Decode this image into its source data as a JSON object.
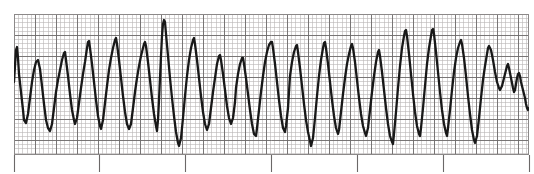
{
  "document": {
    "title": "ECG Rhythm Strip",
    "kind": "electrocardiogram-tracing",
    "background_color": "#ffffff"
  },
  "grid": {
    "x": 14,
    "y": 14,
    "width": 515,
    "height": 141,
    "minor_cell_px": 4.2,
    "major_every_minor_cells": 5,
    "minor_color": "#b9b6b6",
    "major_color": "#6e6b6b",
    "border_color": "#8c8989",
    "minor_line_width": 0.6,
    "major_line_width": 0.9,
    "label": "ECG graph paper"
  },
  "axis_ticks": {
    "label": "time calibration marks",
    "color": "#6b6868",
    "line_width": 1.1,
    "top_y": 155,
    "bottom_y": 172,
    "positions_px": [
      14,
      99,
      185,
      271,
      357,
      443,
      529
    ]
  },
  "trace": {
    "label": "ECG waveform trace",
    "color": "#181818",
    "line_width": 2.3,
    "baseline_y": 88,
    "rhythm": "polymorphic wide-complex tachycardia",
    "amplitude_trend": "attenuating toward right edge"
  },
  "chart_data": {
    "type": "line",
    "xlabel": "Time",
    "ylabel": "Amplitude",
    "grid": true,
    "legend": "none",
    "xlim": [
      14,
      529
    ],
    "ylim": [
      155,
      14
    ],
    "series": [
      {
        "name": "ECG lead tracing",
        "points": [
          [
            14,
            82
          ],
          [
            15,
            66
          ],
          [
            16,
            50
          ],
          [
            17,
            47
          ],
          [
            18,
            58
          ],
          [
            19,
            74
          ],
          [
            21,
            92
          ],
          [
            23,
            110
          ],
          [
            24,
            120
          ],
          [
            26,
            123
          ],
          [
            28,
            114
          ],
          [
            30,
            98
          ],
          [
            32,
            82
          ],
          [
            34,
            70
          ],
          [
            36,
            62
          ],
          [
            38,
            60
          ],
          [
            40,
            69
          ],
          [
            42,
            86
          ],
          [
            44,
            104
          ],
          [
            46,
            120
          ],
          [
            48,
            128
          ],
          [
            50,
            131
          ],
          [
            52,
            124
          ],
          [
            54,
            108
          ],
          [
            56,
            92
          ],
          [
            58,
            80
          ],
          [
            60,
            70
          ],
          [
            62,
            60
          ],
          [
            64,
            53
          ],
          [
            65,
            52
          ],
          [
            66,
            60
          ],
          [
            68,
            76
          ],
          [
            70,
            94
          ],
          [
            72,
            110
          ],
          [
            74,
            120
          ],
          [
            75,
            124
          ],
          [
            77,
            118
          ],
          [
            79,
            103
          ],
          [
            81,
            88
          ],
          [
            83,
            74
          ],
          [
            85,
            62
          ],
          [
            86,
            55
          ],
          [
            87,
            48
          ],
          [
            88,
            42
          ],
          [
            89,
            41
          ],
          [
            90,
            48
          ],
          [
            92,
            64
          ],
          [
            94,
            82
          ],
          [
            96,
            100
          ],
          [
            98,
            116
          ],
          [
            100,
            126
          ],
          [
            101,
            129
          ],
          [
            103,
            120
          ],
          [
            105,
            103
          ],
          [
            107,
            86
          ],
          [
            109,
            70
          ],
          [
            111,
            58
          ],
          [
            113,
            48
          ],
          [
            115,
            40
          ],
          [
            116,
            38
          ],
          [
            117,
            44
          ],
          [
            119,
            60
          ],
          [
            121,
            78
          ],
          [
            123,
            96
          ],
          [
            125,
            112
          ],
          [
            127,
            124
          ],
          [
            129,
            129
          ],
          [
            131,
            124
          ],
          [
            133,
            108
          ],
          [
            135,
            92
          ],
          [
            137,
            78
          ],
          [
            139,
            66
          ],
          [
            141,
            56
          ],
          [
            143,
            48
          ],
          [
            144,
            44
          ],
          [
            145,
            42
          ],
          [
            146,
            46
          ],
          [
            148,
            62
          ],
          [
            150,
            80
          ],
          [
            152,
            98
          ],
          [
            154,
            114
          ],
          [
            156,
            126
          ],
          [
            157,
            131
          ],
          [
            158,
            120
          ],
          [
            159,
            100
          ],
          [
            160,
            78
          ],
          [
            161,
            56
          ],
          [
            162,
            36
          ],
          [
            163,
            24
          ],
          [
            164,
            20
          ],
          [
            165,
            22
          ],
          [
            166,
            34
          ],
          [
            168,
            56
          ],
          [
            170,
            78
          ],
          [
            172,
            98
          ],
          [
            174,
            116
          ],
          [
            176,
            132
          ],
          [
            178,
            143
          ],
          [
            179,
            146
          ],
          [
            181,
            138
          ],
          [
            183,
            118
          ],
          [
            185,
            96
          ],
          [
            187,
            76
          ],
          [
            189,
            60
          ],
          [
            191,
            48
          ],
          [
            193,
            40
          ],
          [
            194,
            38
          ],
          [
            195,
            44
          ],
          [
            197,
            60
          ],
          [
            199,
            78
          ],
          [
            201,
            96
          ],
          [
            203,
            112
          ],
          [
            205,
            124
          ],
          [
            207,
            130
          ],
          [
            209,
            124
          ],
          [
            211,
            108
          ],
          [
            213,
            92
          ],
          [
            215,
            78
          ],
          [
            217,
            64
          ],
          [
            219,
            56
          ],
          [
            220,
            55
          ],
          [
            221,
            60
          ],
          [
            223,
            74
          ],
          [
            225,
            90
          ],
          [
            227,
            106
          ],
          [
            229,
            118
          ],
          [
            231,
            124
          ],
          [
            233,
            118
          ],
          [
            235,
            102
          ],
          [
            236,
            88
          ],
          [
            238,
            74
          ],
          [
            240,
            64
          ],
          [
            242,
            58
          ],
          [
            243,
            58
          ],
          [
            244,
            64
          ],
          [
            246,
            78
          ],
          [
            248,
            94
          ],
          [
            250,
            110
          ],
          [
            252,
            124
          ],
          [
            254,
            134
          ],
          [
            256,
            136
          ],
          [
            257,
            128
          ],
          [
            259,
            110
          ],
          [
            261,
            92
          ],
          [
            263,
            76
          ],
          [
            265,
            62
          ],
          [
            267,
            52
          ],
          [
            269,
            45
          ],
          [
            271,
            42
          ],
          [
            272,
            42
          ],
          [
            273,
            48
          ],
          [
            275,
            64
          ],
          [
            277,
            82
          ],
          [
            279,
            100
          ],
          [
            281,
            116
          ],
          [
            283,
            128
          ],
          [
            285,
            132
          ],
          [
            286,
            126
          ],
          [
            288,
            108
          ],
          [
            289,
            92
          ],
          [
            290,
            76
          ],
          [
            292,
            62
          ],
          [
            294,
            52
          ],
          [
            296,
            46
          ],
          [
            297,
            45
          ],
          [
            298,
            52
          ],
          [
            300,
            68
          ],
          [
            302,
            86
          ],
          [
            304,
            104
          ],
          [
            306,
            120
          ],
          [
            308,
            132
          ],
          [
            310,
            141
          ],
          [
            311,
            146
          ],
          [
            313,
            138
          ],
          [
            315,
            118
          ],
          [
            317,
            96
          ],
          [
            319,
            76
          ],
          [
            321,
            60
          ],
          [
            323,
            48
          ],
          [
            324,
            43
          ],
          [
            325,
            42
          ],
          [
            326,
            48
          ],
          [
            328,
            64
          ],
          [
            330,
            82
          ],
          [
            332,
            100
          ],
          [
            334,
            116
          ],
          [
            336,
            128
          ],
          [
            338,
            134
          ],
          [
            339,
            130
          ],
          [
            341,
            112
          ],
          [
            343,
            94
          ],
          [
            345,
            78
          ],
          [
            347,
            64
          ],
          [
            349,
            54
          ],
          [
            351,
            46
          ],
          [
            352,
            44
          ],
          [
            353,
            48
          ],
          [
            355,
            62
          ],
          [
            357,
            80
          ],
          [
            359,
            98
          ],
          [
            361,
            114
          ],
          [
            363,
            126
          ],
          [
            365,
            133
          ],
          [
            366,
            136
          ],
          [
            368,
            128
          ],
          [
            370,
            110
          ],
          [
            372,
            92
          ],
          [
            374,
            76
          ],
          [
            376,
            62
          ],
          [
            378,
            52
          ],
          [
            379,
            50
          ],
          [
            380,
            56
          ],
          [
            382,
            72
          ],
          [
            384,
            90
          ],
          [
            386,
            108
          ],
          [
            388,
            124
          ],
          [
            390,
            136
          ],
          [
            392,
            142
          ],
          [
            393,
            144
          ],
          [
            394,
            134
          ],
          [
            396,
            112
          ],
          [
            398,
            88
          ],
          [
            400,
            66
          ],
          [
            402,
            48
          ],
          [
            404,
            36
          ],
          [
            405,
            31
          ],
          [
            406,
            30
          ],
          [
            407,
            36
          ],
          [
            409,
            54
          ],
          [
            411,
            74
          ],
          [
            413,
            94
          ],
          [
            415,
            112
          ],
          [
            417,
            126
          ],
          [
            419,
            134
          ],
          [
            420,
            136
          ],
          [
            421,
            128
          ],
          [
            423,
            108
          ],
          [
            425,
            86
          ],
          [
            427,
            64
          ],
          [
            429,
            48
          ],
          [
            431,
            36
          ],
          [
            432,
            30
          ],
          [
            433,
            29
          ],
          [
            434,
            34
          ],
          [
            436,
            52
          ],
          [
            438,
            72
          ],
          [
            440,
            92
          ],
          [
            442,
            110
          ],
          [
            444,
            124
          ],
          [
            446,
            133
          ],
          [
            447,
            136
          ],
          [
            448,
            128
          ],
          [
            450,
            110
          ],
          [
            452,
            90
          ],
          [
            454,
            72
          ],
          [
            456,
            58
          ],
          [
            458,
            48
          ],
          [
            460,
            42
          ],
          [
            461,
            40
          ],
          [
            462,
            44
          ],
          [
            464,
            58
          ],
          [
            466,
            76
          ],
          [
            468,
            96
          ],
          [
            470,
            114
          ],
          [
            472,
            130
          ],
          [
            474,
            140
          ],
          [
            475,
            143
          ],
          [
            477,
            136
          ],
          [
            479,
            118
          ],
          [
            481,
            98
          ],
          [
            483,
            80
          ],
          [
            485,
            66
          ],
          [
            487,
            54
          ],
          [
            488,
            48
          ],
          [
            489,
            46
          ],
          [
            491,
            50
          ],
          [
            493,
            60
          ],
          [
            495,
            72
          ],
          [
            497,
            82
          ],
          [
            499,
            88
          ],
          [
            500,
            90
          ],
          [
            502,
            86
          ],
          [
            504,
            78
          ],
          [
            506,
            70
          ],
          [
            507,
            66
          ],
          [
            508,
            64
          ],
          [
            509,
            68
          ],
          [
            511,
            78
          ],
          [
            513,
            88
          ],
          [
            514,
            92
          ],
          [
            515,
            90
          ],
          [
            516,
            84
          ],
          [
            517,
            78
          ],
          [
            518,
            74
          ],
          [
            519,
            73
          ],
          [
            520,
            76
          ],
          [
            521,
            82
          ],
          [
            523,
            90
          ],
          [
            525,
            98
          ],
          [
            526,
            104
          ],
          [
            527,
            108
          ],
          [
            528,
            110
          ],
          [
            529,
            108
          ]
        ]
      }
    ]
  }
}
